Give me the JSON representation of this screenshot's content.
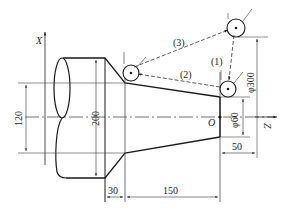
{
  "diagram": {
    "type": "turning-tool-path",
    "axes": {
      "x_label": "X",
      "z_label": "Z",
      "origin_label": "O"
    },
    "path_labels": [
      "(1)",
      "(2)",
      "(3)"
    ],
    "dimensions": {
      "d120": "120",
      "d200": "200",
      "d30": "30",
      "d150": "150",
      "d50": "50",
      "phi60": "φ60",
      "phi300": "φ300"
    },
    "colors": {
      "line": "#1a1a1a",
      "thin": "#555555",
      "background": "#ffffff"
    }
  }
}
